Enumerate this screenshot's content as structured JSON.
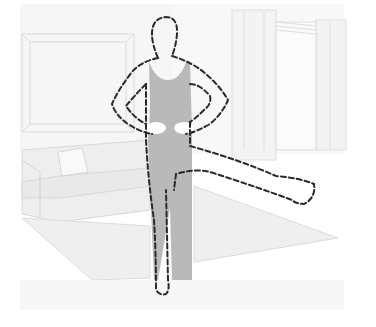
{
  "illustration": {
    "description": "Person standing on one leg with hands on hips and the other leg raised sideways, in a living room",
    "colors": {
      "background": "#ffffff",
      "room_fill": "#f4f4f4",
      "room_lines": "#dcdcdc",
      "clothing": "#b9b9b9",
      "outline": "#2a2a2a"
    },
    "elements": [
      {
        "name": "wall-picture-frame"
      },
      {
        "name": "window-with-curtains"
      },
      {
        "name": "sofa"
      },
      {
        "name": "cushion"
      },
      {
        "name": "rug"
      },
      {
        "name": "person-figure"
      }
    ]
  }
}
